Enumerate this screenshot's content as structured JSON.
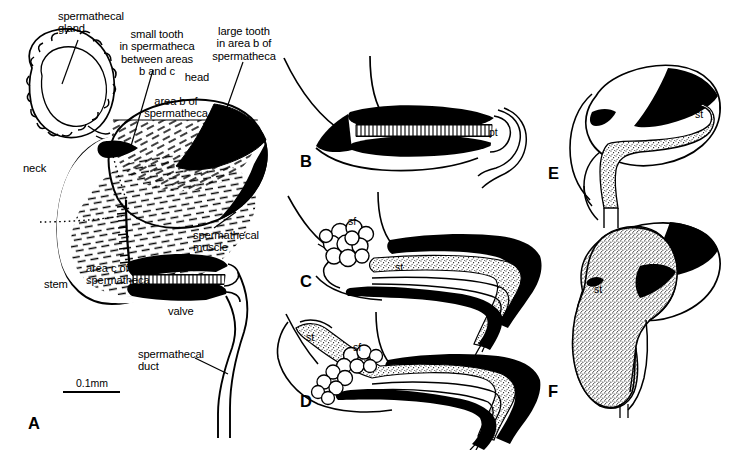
{
  "figure": {
    "type": "scientific-line-drawing",
    "background": "#ffffff",
    "ink": "#000000",
    "width": 729,
    "height": 450
  },
  "scale": {
    "label": "0.1mm",
    "x1": 63,
    "x2": 120,
    "y": 392,
    "text_x": 92,
    "text_y": 377
  },
  "panels": [
    {
      "id": "A",
      "letter": "A",
      "x": 28,
      "y": 414,
      "caption": "whole spermatheca with gland, head, neck, stem and duct"
    },
    {
      "id": "B",
      "letter": "B",
      "x": 300,
      "y": 152,
      "caption": "valve closed, with pt"
    },
    {
      "id": "C",
      "letter": "C",
      "x": 300,
      "y": 272,
      "caption": "valve open, sperm column entering"
    },
    {
      "id": "D",
      "letter": "D",
      "x": 300,
      "y": 392,
      "caption": "sperm column in duct with sperm fluid"
    },
    {
      "id": "E",
      "letter": "E",
      "x": 548,
      "y": 164,
      "caption": "spermatheca beginning to fill"
    },
    {
      "id": "F",
      "letter": "F",
      "x": 548,
      "y": 382,
      "caption": "spermatheca full of sperm"
    }
  ],
  "labels": [
    {
      "name": "spermathecal-gland",
      "text": "spermathecal\ngland",
      "x": 58,
      "y": 10,
      "align": "left"
    },
    {
      "name": "small-tooth",
      "text": "small tooth\nin spermatheca\nbetween areas\nb and c",
      "x": 157,
      "y": 28,
      "align": "center"
    },
    {
      "name": "large-tooth",
      "text": "large tooth\nin area b of\nspermatheca",
      "x": 244,
      "y": 25,
      "align": "center"
    },
    {
      "name": "head",
      "text": "head",
      "x": 197,
      "y": 71,
      "align": "center"
    },
    {
      "name": "area-b",
      "text": "area b of\nspermatheca",
      "x": 176,
      "y": 95,
      "align": "center"
    },
    {
      "name": "neck",
      "text": "neck",
      "x": 23,
      "y": 162,
      "align": "left"
    },
    {
      "name": "spermathecal-muscle",
      "text": "spermathecal\nmuscle",
      "x": 193,
      "y": 229,
      "align": "left"
    },
    {
      "name": "area-c",
      "text": "area c of\nspermatheca",
      "x": 86,
      "y": 262,
      "align": "left"
    },
    {
      "name": "stem",
      "text": "stem",
      "x": 44,
      "y": 278,
      "align": "left"
    },
    {
      "name": "valve",
      "text": "valve",
      "x": 168,
      "y": 305,
      "align": "left"
    },
    {
      "name": "spermathecal-duct",
      "text": "spermathecal\nduct",
      "x": 138,
      "y": 348,
      "align": "left"
    }
  ],
  "abbrev_labels": [
    {
      "name": "pt-label-panel-b",
      "text": "pt",
      "x": 489,
      "y": 126
    },
    {
      "name": "sf-label-panel-c",
      "text": "sf",
      "x": 348,
      "y": 215
    },
    {
      "name": "st-label-panel-c",
      "text": "st",
      "x": 395,
      "y": 261
    },
    {
      "name": "st-label-panel-d",
      "text": "st",
      "x": 306,
      "y": 331
    },
    {
      "name": "sf-label-panel-d",
      "text": "sf",
      "x": 353,
      "y": 341
    },
    {
      "name": "st-label-panel-e",
      "text": "st",
      "x": 695,
      "y": 108
    },
    {
      "name": "st-label-panel-f",
      "text": "st",
      "x": 594,
      "y": 283
    }
  ],
  "abbreviation_key": {
    "pt": "penetration of tooth region",
    "sf": "sperm fluid / sperm mass",
    "st": "sperm (stored sperm column)"
  }
}
